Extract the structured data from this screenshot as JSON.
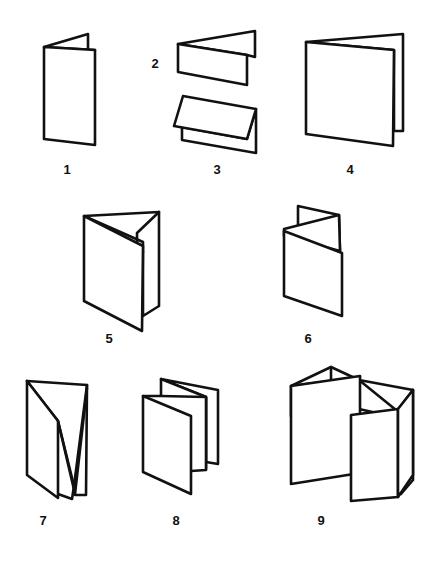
{
  "diagram": {
    "background": "#ffffff",
    "stroke_color": "#111111",
    "figures": [
      {
        "id": "1",
        "label": "1",
        "description": "Single fold (4-page), portrait"
      },
      {
        "id": "2",
        "label": "2",
        "description": "Single fold, landscape (top fold)"
      },
      {
        "id": "3",
        "label": "3",
        "description": "Single fold, landscape (bottom fold / tent)"
      },
      {
        "id": "4",
        "label": "4",
        "description": "Single fold, square"
      },
      {
        "id": "5",
        "label": "5",
        "description": "Roll fold (letter fold, 3 panels)"
      },
      {
        "id": "6",
        "label": "6",
        "description": "Z fold (accordion, 3 panels)"
      },
      {
        "id": "7",
        "label": "7",
        "description": "Roll fold, 4 panels"
      },
      {
        "id": "8",
        "label": "8",
        "description": "Accordion fold, 4 panels"
      },
      {
        "id": "9",
        "label": "9",
        "description": "Gate / double parallel fold, multi panel"
      }
    ]
  }
}
